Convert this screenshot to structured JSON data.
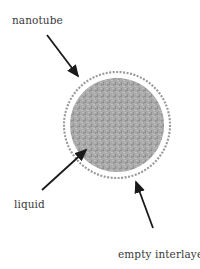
{
  "diagram": {
    "labels": {
      "nanotube": "nanotube",
      "liquid": "liquid",
      "empty_interlayer": "empty interlayer"
    },
    "colors": {
      "liquid_fill": "#a8a8a8",
      "shell_stroke": "#9a9a9a",
      "arrow": "#1a1a1a",
      "text": "#3a3a3a"
    }
  }
}
